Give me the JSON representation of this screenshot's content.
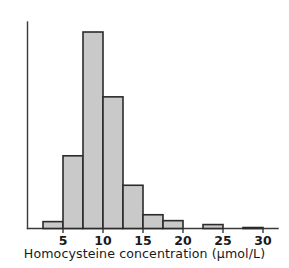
{
  "chart_data": {
    "type": "bar",
    "title": "",
    "subtitle": "",
    "xlabel": "Homocysteine concentration (µmol/L)",
    "ylabel": "",
    "xlim": [
      2.5,
      31.0
    ],
    "ylim": [
      0,
      100
    ],
    "grid": false,
    "legend": null,
    "bin_width": 2.5,
    "bin_edges": [
      2.5,
      5,
      7.5,
      10,
      12.5,
      15,
      17.5,
      20,
      22.5,
      25,
      27.5,
      30
    ],
    "categories": [
      "2.5-5",
      "5-7.5",
      "7.5-10",
      "10-12.5",
      "12.5-15",
      "15-17.5",
      "17.5-20",
      "20-22.5",
      "22.5-25",
      "25-27.5",
      "27.5-30"
    ],
    "values": [
      3.5,
      37,
      100,
      67,
      22,
      7,
      4,
      0,
      2,
      0,
      0.5
    ],
    "xticks": [
      5,
      10,
      15,
      20,
      25,
      30
    ],
    "xtick_labels": [
      "5",
      "10",
      "15",
      "20",
      "25",
      "30"
    ],
    "yticks": [],
    "ytick_labels": [],
    "colors": {
      "bar_fill": "#c9c9c9",
      "bar_stroke": "#2b2b2b",
      "axis": "#3a3a3a",
      "text": "#1a1a1a",
      "background": "#ffffff"
    }
  }
}
